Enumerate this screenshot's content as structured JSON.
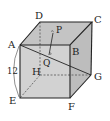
{
  "diagram": {
    "type": "cube",
    "colors": {
      "face_front": "#cfcfcf",
      "face_top": "#c4c4c4",
      "face_right": "#bdbdbd",
      "edge": "#222222",
      "hidden_edge": "#555555"
    },
    "vertices": {
      "A": {
        "label": "A",
        "x": 20,
        "y": 45
      },
      "B": {
        "label": "B",
        "x": 70,
        "y": 45
      },
      "C": {
        "label": "C",
        "x": 92,
        "y": 22
      },
      "D": {
        "label": "D",
        "x": 40,
        "y": 22
      },
      "E": {
        "label": "E",
        "x": 20,
        "y": 98
      },
      "F": {
        "label": "F",
        "x": 70,
        "y": 98
      },
      "G": {
        "label": "G",
        "x": 91,
        "y": 75
      },
      "H": {
        "label": "H",
        "x": 40,
        "y": 75
      }
    },
    "points": {
      "P": {
        "label": "P",
        "x": 53,
        "y": 33
      },
      "Q": {
        "label": "Q",
        "x": 49,
        "y": 55
      }
    },
    "dimension": {
      "label": "12",
      "edge": "AE"
    }
  }
}
